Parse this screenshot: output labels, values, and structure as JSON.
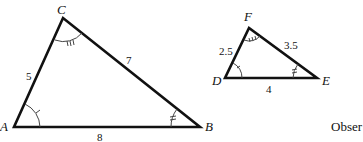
{
  "triangle_abc": {
    "vertices": {
      "A": "A",
      "B": "B",
      "C": "C"
    },
    "sides": {
      "AC": "5",
      "CB": "7",
      "AB": "8"
    },
    "angle_marks": {
      "A": "single tick",
      "B": "double tick",
      "C": "triple tick"
    }
  },
  "triangle_def": {
    "vertices": {
      "D": "D",
      "E": "E",
      "F": "F"
    },
    "sides": {
      "DF": "2.5",
      "FE": "3.5",
      "DE": "4"
    },
    "angle_marks": {
      "D": "single tick",
      "E": "double tick",
      "F": "triple tick"
    }
  },
  "trailing_text": "Obser"
}
